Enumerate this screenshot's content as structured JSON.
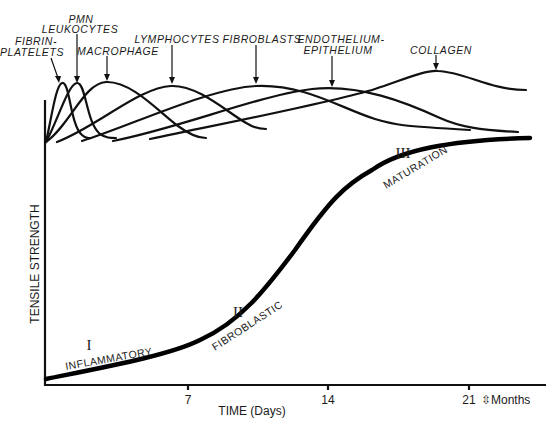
{
  "diagram": {
    "y_axis_label": "TENSILE STRENGTH",
    "x_axis_label": "TIME (Days)",
    "x_ticks": [
      {
        "label": "7",
        "x": 188
      },
      {
        "label": "14",
        "x": 328
      },
      {
        "label": "21",
        "x": 469
      }
    ],
    "x_extension_label": "⇳Months",
    "cell_labels": {
      "fibrin_line1": "FIBRIN-",
      "fibrin_line2": "PLATELETS",
      "pmn_line1": "PMN",
      "pmn_line2": "LEUKOCYTES",
      "macrophage": "MACROPHAGE",
      "lymphocytes": "LYMPHOCYTES",
      "fibroblasts": "FIBROBLASTS",
      "endothelium_line1": "ENDOTHELIUM-",
      "endothelium_line2": "EPITHELIUM",
      "collagen": "COLLAGEN"
    },
    "phases": [
      {
        "numeral": "I",
        "name": "INFLAMMATORY"
      },
      {
        "numeral": "II",
        "name": "FIBROBLASTIC"
      },
      {
        "numeral": "III",
        "name": "MATURATION"
      }
    ]
  }
}
